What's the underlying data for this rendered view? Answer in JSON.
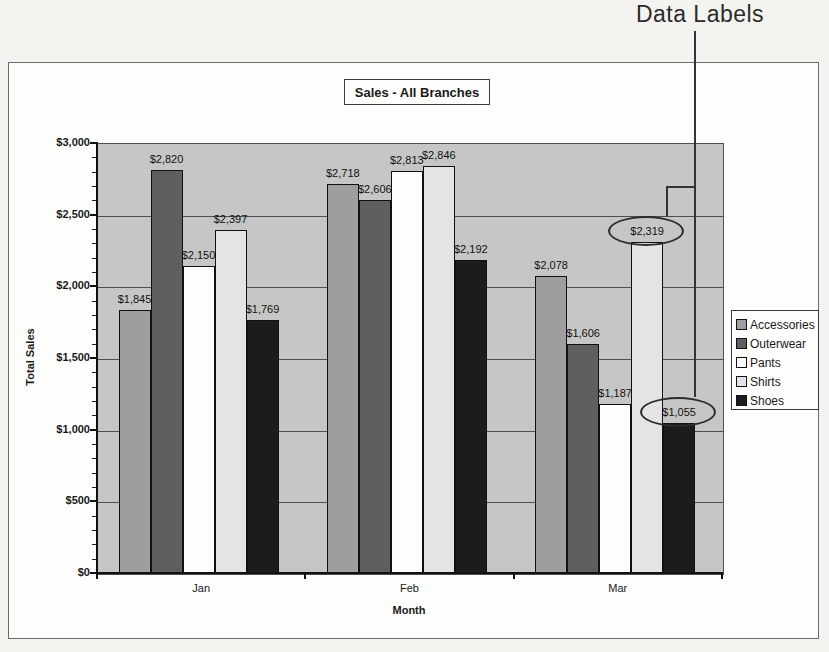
{
  "annotation": {
    "label": "Data Labels"
  },
  "chart_data": {
    "type": "bar",
    "title": "Sales - All Branches",
    "xlabel": "Month",
    "ylabel": "Total Sales",
    "categories": [
      "Jan",
      "Feb",
      "Mar"
    ],
    "series": [
      {
        "name": "Accessories",
        "color": "#9e9e9e",
        "values": [
          1845,
          2718,
          2078
        ],
        "labels": [
          "$1,845",
          "$2,718",
          "$2,078"
        ]
      },
      {
        "name": "Outerwear",
        "color": "#5f5f5f",
        "values": [
          2820,
          2606,
          1606
        ],
        "labels": [
          "$2,820",
          "$2,606",
          "$1,606"
        ]
      },
      {
        "name": "Pants",
        "color": "#fdfdfd",
        "values": [
          2150,
          2813,
          1187
        ],
        "labels": [
          "$2,150",
          "$2,813",
          "$1,187"
        ]
      },
      {
        "name": "Shirts",
        "color": "#e4e4e4",
        "values": [
          2397,
          2846,
          2319
        ],
        "labels": [
          "$2,397",
          "$2,846",
          "$2,319"
        ]
      },
      {
        "name": "Shoes",
        "color": "#1c1c1c",
        "values": [
          1769,
          2192,
          1055
        ],
        "labels": [
          "$1,769",
          "$2,192",
          "$1,055"
        ]
      }
    ],
    "ylim": [
      0,
      3000
    ],
    "ytick_step": 500,
    "ytick_labels": [
      "$3,000",
      "$2,500",
      "$2,000",
      "$1,500",
      "$1,000",
      "$500",
      "$0"
    ],
    "minor_tick_step": 100,
    "grid": true,
    "legend_position": "right",
    "legend_entries": [
      "Accessories",
      "Outerwear",
      "Pants",
      "Shirts",
      "Shoes"
    ],
    "circled_data_labels": [
      "$2,319",
      "$1,055"
    ],
    "circled": [
      {
        "series": 3,
        "category": 2
      },
      {
        "series": 4,
        "category": 2
      }
    ],
    "colors": {
      "plot_bg": "#c6c6c6",
      "gridline": "#4f4f4f",
      "bar_border": "#111111"
    }
  }
}
